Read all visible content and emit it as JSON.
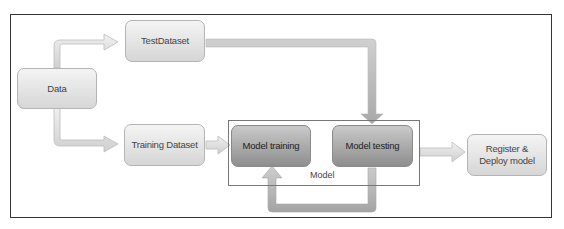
{
  "diagram": {
    "nodes": {
      "data": "Data",
      "test_dataset": "TestDataset",
      "training_dataset": "Training Dataset",
      "model_training": "Model training",
      "model_testing": "Model testing",
      "register_deploy": "Register & Deploy model"
    },
    "group_label": "Model",
    "edges": [
      {
        "from": "Data",
        "to": "TestDataset"
      },
      {
        "from": "Data",
        "to": "Training Dataset"
      },
      {
        "from": "TestDataset",
        "to": "Model testing"
      },
      {
        "from": "Training Dataset",
        "to": "Model training"
      },
      {
        "from": "Model testing",
        "to": "Model training"
      },
      {
        "from": "Model testing",
        "to": "Register & Deploy model"
      }
    ],
    "colors": {
      "light_node": "#e6e6e6",
      "dark_node": "#a8a8a8",
      "arrow_light": "#e2e2e2",
      "arrow_dark": "#a6a6a6",
      "frame": "#333333"
    }
  }
}
